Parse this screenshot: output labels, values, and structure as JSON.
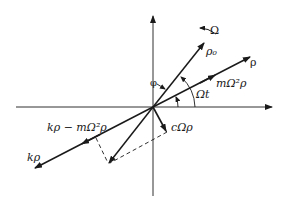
{
  "diagram": {
    "type": "vector phasor diagram (rotating shaft forces)",
    "colors": {
      "line": "#1a1a1a",
      "background": "#ffffff"
    },
    "labels": {
      "omega": "Ω",
      "rho_0": "ρ₀",
      "rho": "ρ",
      "centrifugal": "mΩ²ρ",
      "omega_t": "Ωt",
      "phi": "φ",
      "damping": "cΩρ",
      "net_spring": "kρ − mΩ²ρ",
      "spring": "kρ"
    },
    "elements": [
      "horizontal axis with arrow",
      "vertical axis with arrow",
      "vector ρ at angle Ωt",
      "vector ρ₀ at angle Ωt + φ",
      "rotation arrow Ω",
      "angle arc Ωt",
      "angle arc φ",
      "vector kρ (opposite ρ)",
      "vector kρ − mΩ²ρ",
      "vector cΩρ (perpendicular to ρ)",
      "resultant vector",
      "dashed construction lines"
    ]
  }
}
